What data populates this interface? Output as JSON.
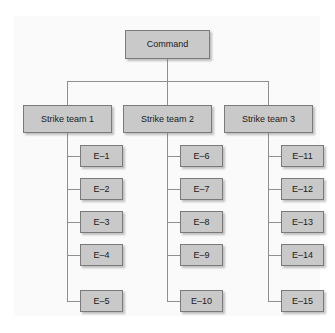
{
  "diagram": {
    "type": "organizational-chart",
    "colors": {
      "node_fill": "#c9c9c9",
      "node_border": "#7a7a7a",
      "line": "#8f8f8f",
      "panel_background": "#fafafa",
      "page_background": "#ffffff",
      "text": "#1a1a1a"
    },
    "root": {
      "label": "Command"
    },
    "branches": [
      {
        "label": "Strike team 1",
        "elements": [
          {
            "label": "E–1"
          },
          {
            "label": "E–2"
          },
          {
            "label": "E–3"
          },
          {
            "label": "E–4"
          },
          {
            "label": "E–5"
          }
        ]
      },
      {
        "label": "Strike team 2",
        "elements": [
          {
            "label": "E–6"
          },
          {
            "label": "E–7"
          },
          {
            "label": "E–8"
          },
          {
            "label": "E–9"
          },
          {
            "label": "E–10"
          }
        ]
      },
      {
        "label": "Strike team 3",
        "elements": [
          {
            "label": "E–11"
          },
          {
            "label": "E–12"
          },
          {
            "label": "E–13"
          },
          {
            "label": "E–14"
          },
          {
            "label": "E–15"
          }
        ]
      }
    ]
  }
}
